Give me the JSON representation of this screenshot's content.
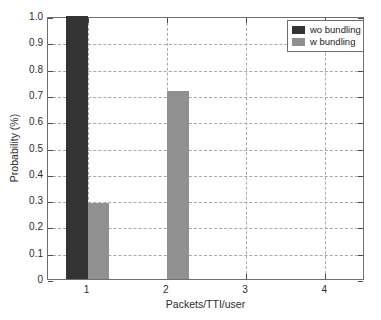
{
  "chart_data": {
    "type": "bar",
    "title": "",
    "xlabel": "Packets/TTI/user",
    "ylabel": "Probability (%)",
    "xlim": [
      0.5,
      4.5
    ],
    "ylim": [
      0,
      1.0
    ],
    "grid": true,
    "legend_position": "top-right",
    "x_tick_labels": [
      "1",
      "2",
      "3",
      "4"
    ],
    "x_tick_values": [
      1,
      2,
      3,
      4
    ],
    "y_tick_labels": [
      "0",
      "0.1",
      "0.2",
      "0.3",
      "0.4",
      "0.5",
      "0.6",
      "0.7",
      "0.8",
      "0.9",
      "1.0"
    ],
    "y_tick_values": [
      0,
      0.1,
      0.2,
      0.3,
      0.4,
      0.5,
      0.6,
      0.7,
      0.8,
      0.9,
      1.0
    ],
    "categories": [
      1,
      2,
      3,
      4
    ],
    "series": [
      {
        "name": "wo bundling",
        "color": "#333333",
        "values": [
          1.0,
          0,
          0,
          0
        ]
      },
      {
        "name": "w bundling",
        "color": "#909090",
        "values": [
          0.29,
          0.715,
          0,
          0
        ]
      }
    ]
  },
  "legend": {
    "entries": [
      {
        "label": "wo bundling",
        "color": "#333333"
      },
      {
        "label": "w bundling",
        "color": "#909090"
      }
    ]
  },
  "axes": {
    "x_title": "Packets/TTI/user",
    "y_title": "Probability (%)"
  }
}
